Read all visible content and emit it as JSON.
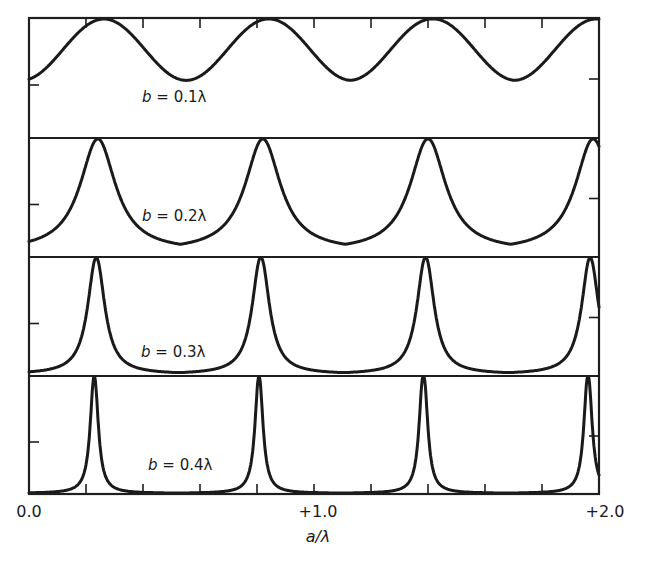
{
  "chart_data": {
    "type": "line",
    "title": "",
    "xlabel": "a/λ",
    "ylabel": "",
    "xlim": [
      0.0,
      2.0
    ],
    "x_tick_labels": [
      "0.0",
      "+1.0",
      "+2.0"
    ],
    "x_tick_label_values": [
      0.0,
      1.0,
      2.0
    ],
    "minor_tick_spacing": 0.2,
    "grid": false,
    "legend": "none",
    "layout": "4 vertically stacked panels sharing the x axis",
    "panels": [
      {
        "label": "b = 0.1λ",
        "label_var": "b",
        "label_rest": " = 0.1λ",
        "b_over_lambda": 0.1,
        "peak_positions": [
          0.263,
          0.84,
          1.42,
          1.99
        ],
        "period": 0.577,
        "peak_value": 1.0,
        "min_value": 0.48,
        "shape": "broad sinusoid-like"
      },
      {
        "label": "b = 0.2λ",
        "label_var": "b",
        "label_rest": " = 0.2λ",
        "b_over_lambda": 0.2,
        "peak_positions": [
          0.242,
          0.82,
          1.4,
          1.98
        ],
        "period": 0.579,
        "peak_value": 1.0,
        "min_value": 0.1,
        "shape": "cusped peaks"
      },
      {
        "label": "b = 0.3λ",
        "label_var": "b",
        "label_rest": " = 0.3λ",
        "b_over_lambda": 0.3,
        "peak_positions": [
          0.235,
          0.815,
          1.39,
          1.97
        ],
        "period": 0.578,
        "peak_value": 1.0,
        "min_value": 0.02,
        "shape": "narrow peaks"
      },
      {
        "label": "b = 0.4λ",
        "label_var": "b",
        "label_rest": " = 0.4λ",
        "b_over_lambda": 0.4,
        "peak_positions": [
          0.228,
          0.808,
          1.385,
          1.96
        ],
        "period": 0.578,
        "peak_value": 1.0,
        "min_value": 0.0,
        "shape": "very sharp peaks"
      }
    ]
  },
  "labels": {
    "x0": "0.0",
    "x1": "+1.0",
    "x2": "+2.0",
    "xaxis": "a/λ"
  }
}
